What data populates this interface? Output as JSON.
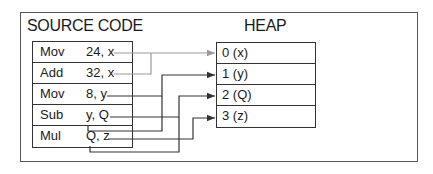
{
  "source": {
    "title": "SOURCE CODE",
    "rows": [
      {
        "op": "Mov",
        "args": "24, x"
      },
      {
        "op": "Add",
        "args": "32, x"
      },
      {
        "op": "Mov",
        "args": "8, y"
      },
      {
        "op": "Sub",
        "args": "y, Q"
      },
      {
        "op": "Mul",
        "args": "Q, z"
      }
    ]
  },
  "heap": {
    "title": "HEAP",
    "cells": [
      "0 (x)",
      "1 (y)",
      "2 (Q)",
      "3 (z)"
    ]
  },
  "colors": {
    "x_link": "#9a9a9a",
    "link": "#333333",
    "border": "#333333"
  }
}
